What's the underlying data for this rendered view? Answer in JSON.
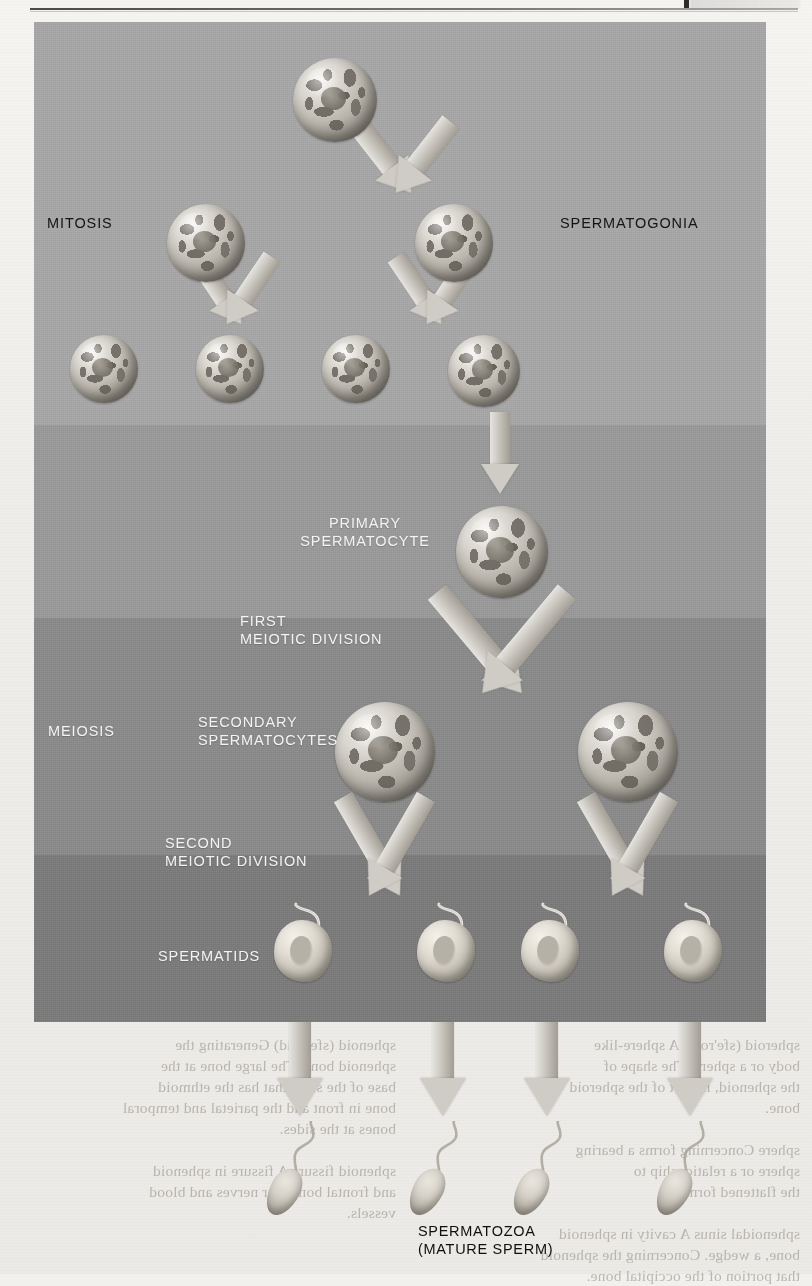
{
  "page": {
    "top_rule": "horizontal-rule",
    "background_color": "#f1efec"
  },
  "diagram": {
    "bands": [
      {
        "name": "mitosis-band",
        "color": "#a6a6a6"
      },
      {
        "name": "primary-spermatocyte-band",
        "color": "#999999"
      },
      {
        "name": "meiosis-band",
        "color": "#8a8a8a"
      },
      {
        "name": "spermatid-band",
        "color": "#7b7b7b"
      }
    ],
    "labels": {
      "mitosis": "MITOSIS",
      "spermatogonia": "SPERMATOGONIA",
      "primary_spermatocyte": "PRIMARY\nSPERMATOCYTE",
      "first_meiotic_division": "FIRST\nMEIOTIC DIVISION",
      "meiosis": "MEIOSIS",
      "secondary_spermatocytes": "SECONDARY\nSPERMATOCYTES",
      "second_meiotic_division": "SECOND\nMEIOTIC DIVISION",
      "spermatids": "SPERMATIDS",
      "spermatozoa": "SPERMATOZOA\n(MATURE SPERM)"
    },
    "cell_counts": {
      "stem_cell": 1,
      "spermatogonia_row2": 2,
      "spermatogonia_row3": 4,
      "primary_spermatocyte": 1,
      "secondary_spermatocytes": 2,
      "spermatids": 4,
      "spermatozoa": 4
    }
  },
  "bleed_through": {
    "left_column": "sphenoid (sfe'noid) Generating the\nsphenoid bone.  The large bone at the\nbase of the skull that has the ethmoid\nbone in front and the parietal and temporal\nbones at the sides.\n\nsphenoid fissure   A fissure in sphenoid\nand frontal bones for nerves and blood\nvessels.",
    "right_column": "spheroid (sfe'roid)   A sphere-like\nbody or a sphere.  The shape of\nthe sphenoid, in part of the spheroid\nbone.\n\nsphere   Concerning   forms  a  bearing\nsphere or a relationship to\nthe flattened form.\n\nsphenoidal sinus   A cavity in sphenoid\nbone, a wedge.  Concerning the sphenoid\nthat portion of the occipital bone."
  }
}
